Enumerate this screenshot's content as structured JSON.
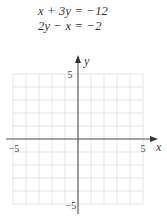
{
  "equations": {
    "eq1": "x + 3y = −12",
    "eq2": "2y − x = −2"
  },
  "graph": {
    "x_axis_label": "x",
    "y_axis_label": "y",
    "x_min_label": "−5",
    "x_max_label": "5",
    "y_min_label": "−5",
    "y_max_label": "5",
    "x_range": [
      -5,
      5
    ],
    "y_range": [
      -5,
      5
    ],
    "grid_color": "#dedede",
    "axis_color": "#555555"
  }
}
